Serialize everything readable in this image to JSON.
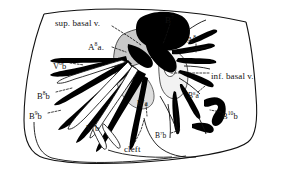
{
  "figure": {
    "kind": "anatomical-line-drawing",
    "background_color": "#ffffff",
    "ink_color": "#111111",
    "shade_color": "#c9c9c9",
    "vessel_fill": "#000000"
  },
  "labels": [
    {
      "id": "sup-basal-v",
      "text": "sup. basal v.",
      "x": 55,
      "y": 19,
      "size": "sz-9"
    },
    {
      "id": "b7-top",
      "base": "B",
      "sup": "7",
      "x": 165,
      "y": 16,
      "size": "sz-9"
    },
    {
      "id": "a8-upper",
      "base": "A",
      "sup": "8",
      "x": 187,
      "y": 36,
      "size": "sz-85"
    },
    {
      "id": "a8a",
      "base": "A",
      "sup": "8",
      "tail": "a.",
      "x": 88,
      "y": 43,
      "size": "sz-9"
    },
    {
      "id": "v8b",
      "base": "V",
      "sup": "8",
      "tail": "b",
      "x": 53,
      "y": 62,
      "size": "sz-85"
    },
    {
      "id": "inf-basal-v",
      "text": "inf. basal v.",
      "x": 211,
      "y": 72,
      "size": "sz-9"
    },
    {
      "id": "b8b-upper",
      "base": "B",
      "sup": "8",
      "tail": "b",
      "x": 37,
      "y": 92,
      "size": "sz-85"
    },
    {
      "id": "b8a-right",
      "base": "B",
      "sup": "8",
      "tail": "a",
      "x": 188,
      "y": 92,
      "size": "sz-75"
    },
    {
      "id": "b7a",
      "base": "B",
      "sup": "7",
      "tail": "a",
      "x": 137,
      "y": 100,
      "size": "sz-75"
    },
    {
      "id": "b9b-lower",
      "base": "B",
      "sup": "9",
      "tail": "b",
      "x": 29,
      "y": 112,
      "size": "sz-85"
    },
    {
      "id": "b10b",
      "base": "B",
      "sup": "10",
      "tail": "b",
      "x": 222,
      "y": 112,
      "size": "sz-85"
    },
    {
      "id": "v9b",
      "base": "V",
      "sup": "9",
      "tail": "b",
      "x": 86,
      "y": 124,
      "size": "sz-85"
    },
    {
      "id": "b7b",
      "base": "B",
      "sup": "7",
      "tail": "b",
      "x": 155,
      "y": 132,
      "size": "sz-75"
    },
    {
      "id": "cleft",
      "text": "cleft",
      "x": 124,
      "y": 145,
      "size": "sz-9"
    }
  ],
  "leaders": [
    {
      "id": "leader-sup-basal-v",
      "d": "M112,26 L131,38 L141,45"
    },
    {
      "id": "leader-b7-top",
      "d": "M170,24 L166,36 L163,44"
    },
    {
      "id": "leader-a8-upper",
      "d": "M196,44 L196,52"
    },
    {
      "id": "leader-a8a",
      "d": "M112,47 L126,52"
    },
    {
      "id": "leader-v8b",
      "d": "M70,63 L84,65"
    },
    {
      "id": "leader-inf-basal",
      "d": "M209,73 L186,73 L170,73"
    },
    {
      "id": "leader-b8b-upper",
      "d": "M56,92 L72,88"
    },
    {
      "id": "leader-b8a-right",
      "d": "M198,92 L205,86"
    },
    {
      "id": "leader-b7a",
      "d": "M146,104 L147,116"
    },
    {
      "id": "leader-b9b-lower",
      "d": "M48,113 L62,110"
    },
    {
      "id": "leader-b10b",
      "d": "M221,112 L210,110"
    },
    {
      "id": "leader-b7b",
      "d": "M171,133 L180,130"
    },
    {
      "id": "leader-cleft",
      "d": "M135,142 L141,130 L144,120"
    }
  ]
}
